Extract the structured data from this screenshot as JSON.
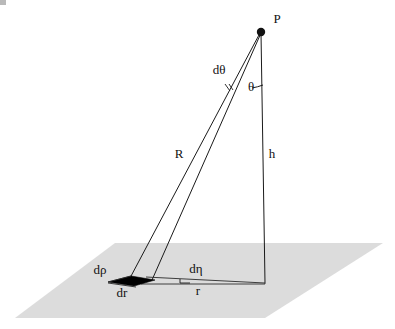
{
  "figure": {
    "background_color": "#ffffff",
    "ink_color": "#1a1a1a",
    "ground_plane_color": "#dcdcdc",
    "patch_fill_color": "#000000",
    "labels": {
      "apex_point": "P",
      "slant_range": "R",
      "height": "h",
      "ground_range": "r",
      "incidence_angle": "θ",
      "delta_angle": "dθ",
      "delta_rho": "dρ",
      "delta_r": "dr",
      "delta_eta": "dη"
    },
    "geometry": {
      "apex": {
        "x": 261,
        "y": 31
      },
      "nadir": {
        "x": 265,
        "y": 283
      },
      "near_foot": {
        "x": 130,
        "y": 278
      },
      "far_foot": {
        "x": 152,
        "y": 280
      },
      "plane_corners": [
        {
          "x": 115,
          "y": 243
        },
        {
          "x": 383,
          "y": 243
        },
        {
          "x": 265,
          "y": 318
        },
        {
          "x": 15,
          "y": 318
        }
      ],
      "patch_corners": [
        {
          "x": 110,
          "y": 281
        },
        {
          "x": 131,
          "y": 277
        },
        {
          "x": 154,
          "y": 280
        },
        {
          "x": 135,
          "y": 285
        }
      ]
    },
    "label_positions": {
      "apex_point": {
        "x": 277,
        "y": 20
      },
      "slant_range": {
        "x": 179,
        "y": 155
      },
      "height": {
        "x": 272,
        "y": 155
      },
      "ground_range": {
        "x": 198,
        "y": 292
      },
      "incidence_angle": {
        "x": 251,
        "y": 88
      },
      "delta_angle": {
        "x": 219,
        "y": 71
      },
      "delta_rho": {
        "x": 100,
        "y": 271
      },
      "delta_r": {
        "x": 122,
        "y": 294
      },
      "delta_eta": {
        "x": 196,
        "y": 270
      }
    }
  }
}
